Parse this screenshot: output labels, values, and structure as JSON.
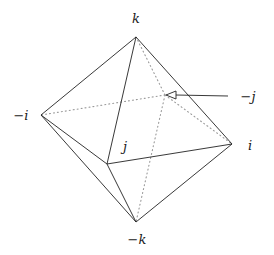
{
  "diagram": {
    "vertices": {
      "k": {
        "x": 136,
        "y": 37,
        "label": "k",
        "lx": 136,
        "ly": 23
      },
      "neg_i": {
        "x": 41,
        "y": 115,
        "label": "−i",
        "lx": 21,
        "ly": 120
      },
      "i": {
        "x": 232,
        "y": 144,
        "label": "i",
        "lx": 250,
        "ly": 150
      },
      "j": {
        "x": 107,
        "y": 164,
        "label": "j",
        "lx": 125,
        "ly": 151
      },
      "neg_k": {
        "x": 136,
        "y": 222,
        "label": "−k",
        "lx": 137,
        "ly": 244
      },
      "neg_j": {
        "x": 165,
        "y": 95,
        "label": "−j",
        "lx": 248,
        "ly": 101
      }
    },
    "solid_edges": [
      [
        "k",
        "neg_i"
      ],
      [
        "k",
        "i"
      ],
      [
        "k",
        "j"
      ],
      [
        "neg_i",
        "j"
      ],
      [
        "neg_i",
        "neg_k"
      ],
      [
        "j",
        "i"
      ],
      [
        "j",
        "neg_k"
      ],
      [
        "i",
        "neg_k"
      ]
    ],
    "dotted_edges": [
      [
        "neg_j",
        "k"
      ],
      [
        "neg_j",
        "neg_i"
      ],
      [
        "neg_j",
        "i"
      ],
      [
        "neg_j",
        "neg_k"
      ]
    ],
    "arrow": {
      "from": [
        228,
        96
      ],
      "to": [
        166,
        95
      ],
      "points_to": "neg_j"
    },
    "colors": {
      "line": "#222222",
      "dotted": "#999999"
    }
  }
}
